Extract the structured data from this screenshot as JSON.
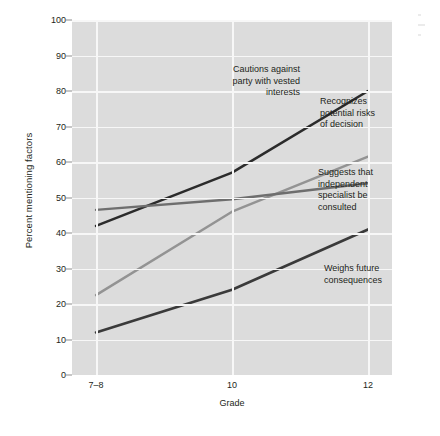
{
  "chart_data": {
    "type": "line",
    "title": "",
    "xlabel": "Grade",
    "ylabel": "Percent mentioning factors",
    "categories": [
      "7-8",
      "10",
      "12"
    ],
    "x_tick_labels": [
      "7–8",
      "10",
      "12"
    ],
    "y_tick_labels": [
      "0",
      "10",
      "20",
      "30",
      "40",
      "50",
      "60",
      "70",
      "80",
      "90",
      "100"
    ],
    "y_tick_values": [
      0,
      10,
      20,
      30,
      40,
      50,
      60,
      70,
      80,
      90,
      100
    ],
    "ylim": [
      0,
      100
    ],
    "grid": true,
    "legend_position": "inline-annotations",
    "plot_background": "#dcdcdc",
    "gridline_color": "#f7f7f7",
    "series": [
      {
        "name": "Cautions against party with vested interests",
        "values": [
          42,
          57,
          80
        ],
        "color": "#2b2b2b",
        "width": 2.6
      },
      {
        "name": "Recognizes potential risks of decision",
        "values": [
          22.5,
          46,
          61.5
        ],
        "color": "#939393",
        "width": 2.4
      },
      {
        "name": "Suggests that independent specialist be consulted",
        "values": [
          46.5,
          49.5,
          54
        ],
        "color": "#6e6e6e",
        "width": 2.4
      },
      {
        "name": "Weighs future consequences",
        "values": [
          12,
          24,
          41
        ],
        "color": "#3a3a3a",
        "width": 2.6
      }
    ],
    "annotations": [
      {
        "id": "cautions",
        "text": "Cautions against\nparty with vested\ninterests",
        "series": "Cautions against party with vested interests"
      },
      {
        "id": "recognizes",
        "text": "Recognizes\npotential risks\nof decision",
        "series": "Recognizes potential risks of decision"
      },
      {
        "id": "suggests",
        "text": "Suggests that\nindependent\nspecialist be\nconsulted",
        "series": "Suggests that independent specialist be consulted"
      },
      {
        "id": "weighs",
        "text": "Weighs future\nconsequences",
        "series": "Weighs future consequences"
      }
    ]
  }
}
